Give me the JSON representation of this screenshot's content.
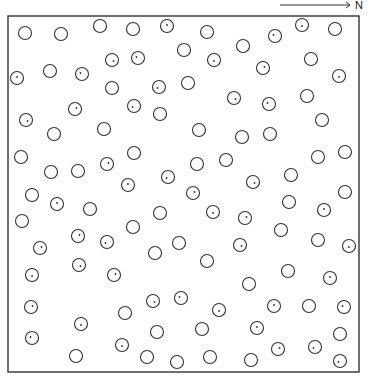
{
  "figure": {
    "north_label": "N",
    "frame": {
      "x": 8,
      "y": 16,
      "width": 351,
      "height": 356
    },
    "arrow": {
      "x1": 280,
      "y1": 5,
      "x2": 350,
      "y2": 5
    },
    "circle_radius": 6.5,
    "stroke_color": "#333333",
    "circles": [
      {
        "x": 25,
        "y": 33,
        "mark": false
      },
      {
        "x": 61,
        "y": 34,
        "mark": false
      },
      {
        "x": 100,
        "y": 26,
        "mark": false
      },
      {
        "x": 133,
        "y": 29,
        "mark": false
      },
      {
        "x": 167,
        "y": 26,
        "mark": true
      },
      {
        "x": 207,
        "y": 32,
        "mark": false
      },
      {
        "x": 275,
        "y": 36,
        "mark": true
      },
      {
        "x": 302,
        "y": 25,
        "mark": true
      },
      {
        "x": 335,
        "y": 29,
        "mark": false
      },
      {
        "x": 184,
        "y": 50,
        "mark": false
      },
      {
        "x": 243,
        "y": 46,
        "mark": false
      },
      {
        "x": 112,
        "y": 60,
        "mark": true
      },
      {
        "x": 138,
        "y": 58,
        "mark": true
      },
      {
        "x": 214,
        "y": 60,
        "mark": true
      },
      {
        "x": 263,
        "y": 68,
        "mark": true
      },
      {
        "x": 311,
        "y": 59,
        "mark": false
      },
      {
        "x": 17,
        "y": 78,
        "mark": true
      },
      {
        "x": 50,
        "y": 71,
        "mark": false
      },
      {
        "x": 82,
        "y": 74,
        "mark": true
      },
      {
        "x": 339,
        "y": 76,
        "mark": true
      },
      {
        "x": 112,
        "y": 88,
        "mark": false
      },
      {
        "x": 159,
        "y": 87,
        "mark": true
      },
      {
        "x": 188,
        "y": 83,
        "mark": false
      },
      {
        "x": 234,
        "y": 98,
        "mark": true
      },
      {
        "x": 269,
        "y": 104,
        "mark": true
      },
      {
        "x": 307,
        "y": 96,
        "mark": false
      },
      {
        "x": 75,
        "y": 109,
        "mark": true
      },
      {
        "x": 134,
        "y": 106,
        "mark": true
      },
      {
        "x": 160,
        "y": 114,
        "mark": false
      },
      {
        "x": 26,
        "y": 120,
        "mark": true
      },
      {
        "x": 322,
        "y": 120,
        "mark": false
      },
      {
        "x": 54,
        "y": 134,
        "mark": false
      },
      {
        "x": 104,
        "y": 129,
        "mark": false
      },
      {
        "x": 199,
        "y": 130,
        "mark": false
      },
      {
        "x": 242,
        "y": 137,
        "mark": false
      },
      {
        "x": 270,
        "y": 134,
        "mark": false
      },
      {
        "x": 21,
        "y": 157,
        "mark": false
      },
      {
        "x": 134,
        "y": 153,
        "mark": false
      },
      {
        "x": 107,
        "y": 164,
        "mark": true
      },
      {
        "x": 197,
        "y": 164,
        "mark": false
      },
      {
        "x": 226,
        "y": 160,
        "mark": false
      },
      {
        "x": 318,
        "y": 157,
        "mark": false
      },
      {
        "x": 345,
        "y": 152,
        "mark": false
      },
      {
        "x": 51,
        "y": 172,
        "mark": false
      },
      {
        "x": 78,
        "y": 171,
        "mark": false
      },
      {
        "x": 168,
        "y": 177,
        "mark": true
      },
      {
        "x": 128,
        "y": 185,
        "mark": true
      },
      {
        "x": 253,
        "y": 182,
        "mark": true
      },
      {
        "x": 291,
        "y": 175,
        "mark": false
      },
      {
        "x": 32,
        "y": 195,
        "mark": false
      },
      {
        "x": 193,
        "y": 193,
        "mark": true
      },
      {
        "x": 345,
        "y": 192,
        "mark": false
      },
      {
        "x": 57,
        "y": 204,
        "mark": true
      },
      {
        "x": 90,
        "y": 209,
        "mark": false
      },
      {
        "x": 160,
        "y": 213,
        "mark": false
      },
      {
        "x": 213,
        "y": 212,
        "mark": true
      },
      {
        "x": 245,
        "y": 218,
        "mark": true
      },
      {
        "x": 289,
        "y": 202,
        "mark": false
      },
      {
        "x": 324,
        "y": 210,
        "mark": true
      },
      {
        "x": 22,
        "y": 221,
        "mark": false
      },
      {
        "x": 133,
        "y": 227,
        "mark": false
      },
      {
        "x": 281,
        "y": 230,
        "mark": false
      },
      {
        "x": 78,
        "y": 236,
        "mark": true
      },
      {
        "x": 107,
        "y": 242,
        "mark": true
      },
      {
        "x": 179,
        "y": 243,
        "mark": false
      },
      {
        "x": 240,
        "y": 245,
        "mark": true
      },
      {
        "x": 318,
        "y": 240,
        "mark": false
      },
      {
        "x": 349,
        "y": 246,
        "mark": true
      },
      {
        "x": 40,
        "y": 248,
        "mark": true
      },
      {
        "x": 155,
        "y": 253,
        "mark": false
      },
      {
        "x": 207,
        "y": 261,
        "mark": false
      },
      {
        "x": 79,
        "y": 265,
        "mark": true
      },
      {
        "x": 288,
        "y": 271,
        "mark": false
      },
      {
        "x": 32,
        "y": 275,
        "mark": true
      },
      {
        "x": 114,
        "y": 275,
        "mark": true
      },
      {
        "x": 249,
        "y": 284,
        "mark": false
      },
      {
        "x": 330,
        "y": 278,
        "mark": true
      },
      {
        "x": 153,
        "y": 301,
        "mark": true
      },
      {
        "x": 181,
        "y": 298,
        "mark": true
      },
      {
        "x": 219,
        "y": 310,
        "mark": true
      },
      {
        "x": 31,
        "y": 307,
        "mark": true
      },
      {
        "x": 125,
        "y": 313,
        "mark": false
      },
      {
        "x": 274,
        "y": 306,
        "mark": true
      },
      {
        "x": 309,
        "y": 306,
        "mark": false
      },
      {
        "x": 344,
        "y": 307,
        "mark": true
      },
      {
        "x": 81,
        "y": 324,
        "mark": true
      },
      {
        "x": 157,
        "y": 332,
        "mark": false
      },
      {
        "x": 202,
        "y": 329,
        "mark": false
      },
      {
        "x": 257,
        "y": 328,
        "mark": true
      },
      {
        "x": 340,
        "y": 334,
        "mark": false
      },
      {
        "x": 32,
        "y": 338,
        "mark": true
      },
      {
        "x": 122,
        "y": 345,
        "mark": true
      },
      {
        "x": 278,
        "y": 349,
        "mark": true
      },
      {
        "x": 315,
        "y": 347,
        "mark": true
      },
      {
        "x": 76,
        "y": 356,
        "mark": false
      },
      {
        "x": 147,
        "y": 357,
        "mark": false
      },
      {
        "x": 177,
        "y": 362,
        "mark": false
      },
      {
        "x": 210,
        "y": 357,
        "mark": false
      },
      {
        "x": 251,
        "y": 360,
        "mark": false
      },
      {
        "x": 340,
        "y": 361,
        "mark": true
      }
    ]
  }
}
